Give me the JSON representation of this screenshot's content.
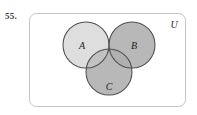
{
  "problem": {
    "number": "55."
  },
  "diagram": {
    "type": "venn-diagram",
    "universe_label": "U",
    "set_labels": [
      "A",
      "B",
      "C"
    ],
    "sets": [
      {
        "name": "A",
        "label": "A",
        "cx": 86,
        "cy": 45,
        "r": 23,
        "fill": "#dcdcdc"
      },
      {
        "name": "B",
        "label": "B",
        "cx": 132,
        "cy": 45,
        "r": 23,
        "fill": "#b9b9b9"
      },
      {
        "name": "C",
        "label": "C",
        "cx": 109,
        "cy": 72,
        "r": 23,
        "fill": "#b9b9b9"
      }
    ],
    "universe_rect": {
      "x": 29,
      "y": 13,
      "width": 157,
      "height": 94,
      "radius": 7
    },
    "colors": {
      "light_gray": "#dcdcdc",
      "mid_gray": "#b9b9b9",
      "stroke": "#4a4a4a",
      "rect_stroke": "#bdbdbd",
      "background": "#ffffff",
      "text": "#1c1c1c"
    }
  }
}
